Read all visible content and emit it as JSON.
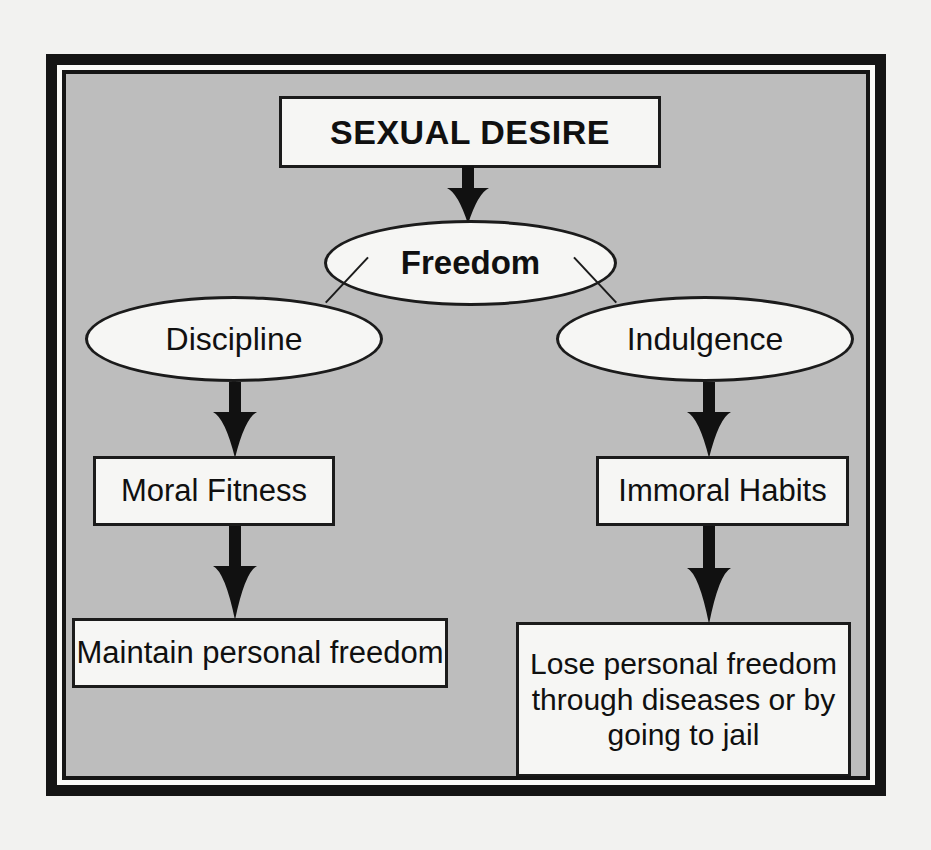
{
  "diagram": {
    "background_color": "#bdbdbd",
    "node_fill_color": "#f6f6f4",
    "stroke_color": "#1b1b1b",
    "frame_color": "#151515",
    "nodes": {
      "sexual_desire": {
        "label": "SEXUAL DESIRE",
        "shape": "rectangle",
        "weight": "bold"
      },
      "freedom": {
        "label": "Freedom",
        "shape": "ellipse",
        "weight": "bold"
      },
      "discipline": {
        "label": "Discipline",
        "shape": "ellipse",
        "weight": "normal"
      },
      "indulgence": {
        "label": "Indulgence",
        "shape": "ellipse",
        "weight": "normal"
      },
      "moral_fitness": {
        "label": "Moral Fitness",
        "shape": "rectangle",
        "weight": "normal"
      },
      "immoral_habits": {
        "label": "Immoral Habits",
        "shape": "rectangle",
        "weight": "normal"
      },
      "maintain_freedom": {
        "label": "Maintain personal freedom",
        "shape": "rectangle",
        "weight": "normal"
      },
      "lose_freedom": {
        "shape": "rectangle",
        "weight": "normal",
        "line1": "Lose personal freedom",
        "line2": "through diseases or by",
        "line3": "going to jail"
      }
    },
    "edges": [
      {
        "from": "sexual_desire",
        "to": "freedom",
        "style": "block-arrow",
        "direction": "down"
      },
      {
        "from": "freedom",
        "to": "discipline",
        "style": "thin-line",
        "direction": "down-left"
      },
      {
        "from": "freedom",
        "to": "indulgence",
        "style": "thin-line",
        "direction": "down-right"
      },
      {
        "from": "discipline",
        "to": "moral_fitness",
        "style": "block-arrow",
        "direction": "down"
      },
      {
        "from": "indulgence",
        "to": "immoral_habits",
        "style": "block-arrow",
        "direction": "down"
      },
      {
        "from": "moral_fitness",
        "to": "maintain_freedom",
        "style": "block-arrow",
        "direction": "down"
      },
      {
        "from": "immoral_habits",
        "to": "lose_freedom",
        "style": "block-arrow",
        "direction": "down"
      }
    ],
    "icons": {
      "down_arrow": "down-block-arrow"
    }
  }
}
